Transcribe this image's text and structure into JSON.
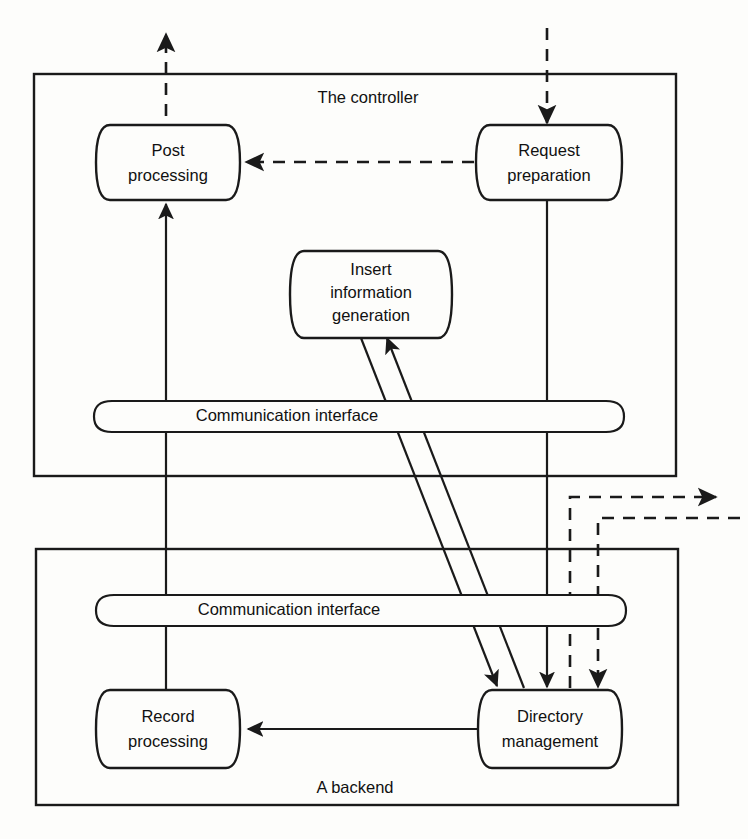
{
  "diagram": {
    "title_controller": "The controller",
    "title_backend": "A backend",
    "nodes": {
      "post_processing": "Post\nprocessing",
      "post_processing_line1": "Post",
      "post_processing_line2": "processing",
      "request_preparation_line1": "Request",
      "request_preparation_line2": "preparation",
      "insert_info_line1": "Insert",
      "insert_info_line2": "information",
      "insert_info_line3": "generation",
      "record_processing_line1": "Record",
      "record_processing_line2": "processing",
      "directory_management_line1": "Directory",
      "directory_management_line2": "management",
      "comm_interface_controller": "Communication interface",
      "comm_interface_backend": "Communication interface"
    },
    "colors": {
      "stroke": "#1a1a1a",
      "background": "#fdfdfb",
      "text": "#111111"
    }
  }
}
